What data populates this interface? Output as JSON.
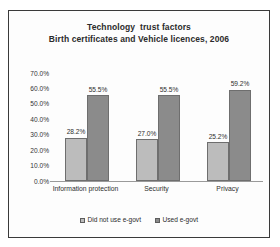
{
  "chart_data": {
    "type": "bar",
    "title": "Technology  trust factors",
    "subtitle": "Birth certificates and Vehicle licences, 2006",
    "xlabel": "",
    "ylabel": "",
    "ylim": [
      0,
      70
    ],
    "grid": false,
    "legend_position": "bottom",
    "ytick_labels": [
      "70.0%",
      "60.0%",
      "50.0%",
      "40.0%",
      "30.0%",
      "20.0%",
      "10.0%",
      "0.0%"
    ],
    "ytick_values": [
      70,
      60,
      50,
      40,
      30,
      20,
      10,
      0
    ],
    "categories": [
      "Information protection",
      "Security",
      "Privacy"
    ],
    "series": [
      {
        "name": "Did not use e-govt",
        "color": "#bcbcbc",
        "values": [
          28.2,
          27.0,
          25.2
        ],
        "labels": [
          "28.2%",
          "27.0%",
          "25.2%"
        ]
      },
      {
        "name": "Used e-govt",
        "color": "#8b8b8b",
        "values": [
          55.5,
          55.5,
          59.2
        ],
        "labels": [
          "55.5%",
          "55.5%",
          "59.2%"
        ]
      }
    ]
  }
}
